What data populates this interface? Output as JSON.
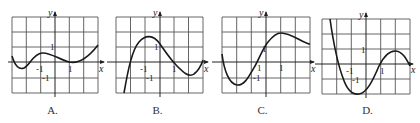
{
  "graphs": [
    {
      "id": "A",
      "caption": "A.",
      "x_axis_label": "x",
      "y_axis_label": "y",
      "tick_labels": {
        "x_neg": "-1",
        "x_pos": "1",
        "y_pos": "1",
        "y_neg": "-1"
      },
      "description": "Curve starts near y=0.3 at x=-3, dips to min about -0.4 near x=-2.4, rises to local max ~0.6 near x=-1, dips to local min ~0 at x=1, rises to ~1.2 at x=3"
    },
    {
      "id": "B",
      "caption": "B.",
      "x_axis_label": "x",
      "y_axis_label": "y",
      "tick_labels": {
        "x_neg": "-1",
        "x_pos": "1",
        "y_pos": "1",
        "y_neg": "-1"
      },
      "description": "Curve rises steeply from bottom near x=-2.5, local max ~1.8 near x=-0.7, crosses x-axis near x=1, local min ~-0.8 near x=2, rises to ~0 at x=3"
    },
    {
      "id": "C",
      "caption": "C.",
      "x_axis_label": "x",
      "y_axis_label": "y",
      "tick_labels": {
        "x_neg": "1",
        "x_pos": "1",
        "y_pos": "1",
        "y_neg": "-1"
      },
      "description": "Curve starts ~0.5 at x=-3, dips to min ~-1.5 near x=-2, rises through origin area, local max ~2 near x=1.3, decreases to ~1.2 at x=3"
    },
    {
      "id": "D",
      "caption": "D.",
      "x_axis_label": "x",
      "y_axis_label": "y",
      "tick_labels": {
        "x_neg": "-1",
        "x_pos": "1",
        "y_pos": "1",
        "y_neg": "-1"
      },
      "description": "Curve descends steeply from top at x=-2.7, min ~-2 near x=-0.7, crosses x-axis near x=1, local max ~1 near x=2, decreases to ~0 at x=3"
    }
  ]
}
